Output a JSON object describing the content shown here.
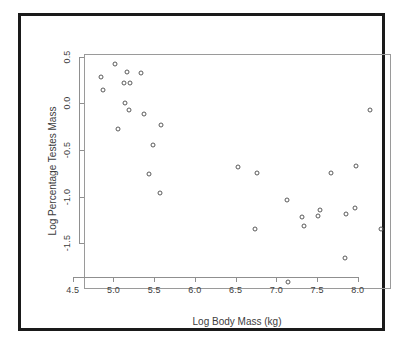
{
  "figure": {
    "background_color": "#ffffff",
    "frame_color": "#1a1a1a",
    "axis_color": "#8f8f8f",
    "point_color": "#5a5a5a"
  },
  "chart_data": {
    "type": "scatter",
    "title": "",
    "subtitle": "",
    "xlabel": "Log Body Mass (kg)",
    "ylabel": "Log Percentage Testes Mass",
    "xlim": [
      4.38,
      8.15
    ],
    "ylim": [
      -1.82,
      0.7
    ],
    "xticks": [
      4.5,
      5.0,
      5.5,
      6.0,
      6.5,
      7.0,
      7.5,
      8.0
    ],
    "xticklabels": [
      "4.5",
      "5.0",
      "5.5",
      "6.0",
      "6.5",
      "7.0",
      "7.5",
      "8.0"
    ],
    "yticks": [
      0.5,
      0.0,
      -0.5,
      -1.0,
      -1.5
    ],
    "yticklabels": [
      "0.5",
      "0.0",
      "-0.5",
      "-1.0",
      "-1.5"
    ],
    "grid": false,
    "legend": null,
    "marker": "open-circle",
    "n_points": 31,
    "x": [
      4.58,
      4.6,
      4.75,
      4.78,
      4.86,
      4.87,
      4.89,
      4.92,
      4.93,
      5.07,
      5.1,
      5.16,
      5.22,
      5.3,
      5.31,
      6.26,
      6.47,
      6.49,
      6.86,
      6.87,
      7.05,
      7.07,
      7.24,
      7.26,
      7.4,
      7.57,
      7.58,
      7.7,
      7.71,
      7.88,
      8.02
    ],
    "y": [
      0.46,
      0.33,
      0.6,
      -0.09,
      0.4,
      0.19,
      0.52,
      0.11,
      0.4,
      0.51,
      0.07,
      -0.58,
      -0.27,
      -0.78,
      -0.05,
      -0.5,
      -1.17,
      -0.57,
      -0.85,
      -1.73,
      -1.04,
      -1.13,
      -1.03,
      -0.96,
      -0.56,
      -1.48,
      -1.01,
      -0.94,
      -0.49,
      0.11,
      -1.17
    ]
  }
}
